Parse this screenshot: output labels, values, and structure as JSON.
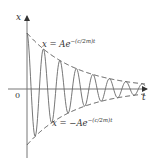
{
  "chart_data": {
    "type": "line",
    "title": "",
    "xlabel": "t",
    "ylabel": "x",
    "origin_label": "0",
    "grid": false,
    "legend": null,
    "series": [
      {
        "name": "x(t) damped oscillation",
        "style": "solid",
        "description": "Oscillation decaying within envelope, starting at max A at t=0"
      },
      {
        "name": "upper envelope",
        "style": "dashed",
        "equation": "x = Ae^{-(c/2m)t}"
      },
      {
        "name": "lower envelope",
        "style": "dashed",
        "equation": "x = -Ae^{-(c/2m)t}"
      }
    ],
    "annotations": [
      {
        "text_main": "x = Ae",
        "text_sup": "−(c/2m)t",
        "position": "upper"
      },
      {
        "text_main": "x = −Ae",
        "text_sup": "−(c/2m)t",
        "position": "lower"
      }
    ]
  },
  "labels": {
    "x_axis": "t",
    "y_axis": "x",
    "origin": "0",
    "upper_main": "x = Ae",
    "upper_sup": "−(c/2m)t",
    "lower_main": "x = −Ae",
    "lower_sup": "−(c/2m)t"
  }
}
